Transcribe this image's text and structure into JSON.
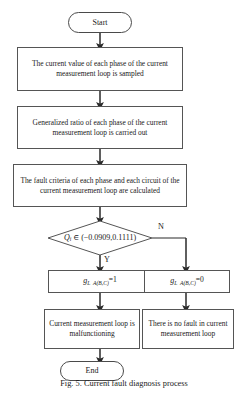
{
  "figure": {
    "caption": "Fig. 5. Current fault diagnosis process"
  },
  "flowchart": {
    "type": "flowchart",
    "orientation": "top-to-bottom",
    "nodes": [
      {
        "id": "start",
        "shape": "terminal",
        "label": "Start"
      },
      {
        "id": "sample",
        "shape": "process",
        "label": "The current value of each phase of the current measurement loop is sampled"
      },
      {
        "id": "ratio",
        "shape": "process",
        "label": "Generalized ratio of each phase of the current measurement loop is carried out"
      },
      {
        "id": "criteria",
        "shape": "process",
        "label": "The fault criteria of each phase and each circuit of the current measurement loop are calculated"
      },
      {
        "id": "decision",
        "shape": "decision",
        "label": "Qi ∈ (−0.0909, 0.1111)",
        "variable": "Q",
        "subscript": "i",
        "operator": "∈",
        "interval_open": "(",
        "lower_bound": "−0.0909",
        "separator": ",",
        "upper_bound": "0.1111",
        "interval_close": ")"
      },
      {
        "id": "g-one",
        "shape": "process",
        "label": "gL A(B,C) =1",
        "variable": "g",
        "subscript": "L  A(B,C)",
        "value": "=1"
      },
      {
        "id": "g-zero",
        "shape": "process",
        "label": "gL A(B,C) =0",
        "variable": "g",
        "subscript": "L  A(B,C)",
        "value": "=0"
      },
      {
        "id": "malfunction",
        "shape": "process",
        "label": "Current measurement loop is malfunctioning"
      },
      {
        "id": "no-fault",
        "shape": "process",
        "label": "There is no fault in current measurement loop"
      },
      {
        "id": "end",
        "shape": "terminal",
        "label": "End"
      }
    ],
    "branches": {
      "yes_label": "Y",
      "no_label": "N"
    },
    "colors": {
      "stroke": "#555555",
      "text": "#1a1a1a",
      "background": "#ffffff"
    }
  }
}
